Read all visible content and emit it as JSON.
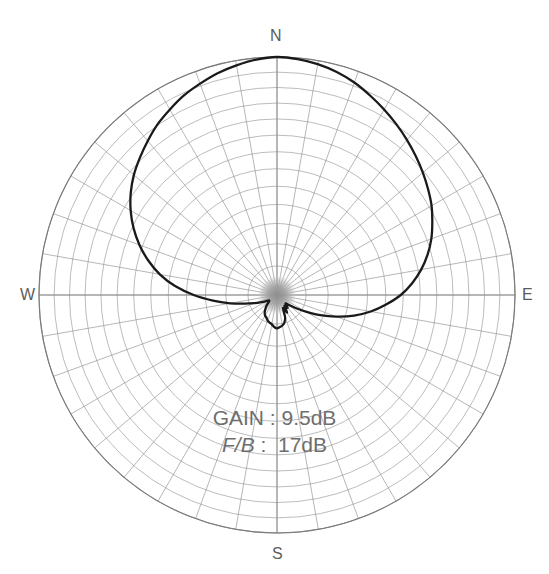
{
  "chart_data": {
    "type": "line",
    "subtype": "polar-radiation-pattern",
    "title": "",
    "xlabel": "",
    "ylabel": "",
    "grid": true,
    "legend_position": "none",
    "center": {
      "x": 277,
      "y": 295
    },
    "outer_radius": 238,
    "rings": 13,
    "spokes": 36,
    "spoke_step_deg": 10,
    "axis_range_deg": [
      0,
      360
    ],
    "cardinal_labels": {
      "north": "N",
      "south": "S",
      "east": "E",
      "west": "W"
    },
    "annotations": [
      {
        "label": "GAIN",
        "separator": ":",
        "value": "9.5dB",
        "italic_label": false
      },
      {
        "label": "F/B",
        "separator": ":",
        "value": "17dB",
        "italic_label": true
      }
    ],
    "colors": {
      "pattern_line": "#1a1a1a",
      "grid_line": "#8f8f8f",
      "outer_circle": "#7a7a7a",
      "center_blob": "#9b9b9b",
      "label_text": "#5c5c5c",
      "annotation_text": "#6e6e6e",
      "background": "#ffffff"
    },
    "series": [
      {
        "name": "radiation-pattern",
        "angle_unit": "degrees-from-north-clockwise",
        "radius_unit": "normalized-0-to-1",
        "points": [
          {
            "angle": 0,
            "r": 1.0
          },
          {
            "angle": 5,
            "r": 0.995
          },
          {
            "angle": 10,
            "r": 0.985
          },
          {
            "angle": 15,
            "r": 0.97
          },
          {
            "angle": 20,
            "r": 0.95
          },
          {
            "angle": 25,
            "r": 0.925
          },
          {
            "angle": 30,
            "r": 0.9
          },
          {
            "angle": 35,
            "r": 0.875
          },
          {
            "angle": 40,
            "r": 0.85
          },
          {
            "angle": 45,
            "r": 0.825
          },
          {
            "angle": 50,
            "r": 0.8
          },
          {
            "angle": 55,
            "r": 0.775
          },
          {
            "angle": 60,
            "r": 0.75
          },
          {
            "angle": 65,
            "r": 0.72
          },
          {
            "angle": 70,
            "r": 0.69
          },
          {
            "angle": 75,
            "r": 0.655
          },
          {
            "angle": 80,
            "r": 0.615
          },
          {
            "angle": 85,
            "r": 0.57
          },
          {
            "angle": 90,
            "r": 0.52
          },
          {
            "angle": 95,
            "r": 0.46
          },
          {
            "angle": 100,
            "r": 0.4
          },
          {
            "angle": 105,
            "r": 0.335
          },
          {
            "angle": 110,
            "r": 0.265
          },
          {
            "angle": 115,
            "r": 0.2
          },
          {
            "angle": 120,
            "r": 0.14
          },
          {
            "angle": 125,
            "r": 0.095
          },
          {
            "angle": 130,
            "r": 0.065
          },
          {
            "angle": 135,
            "r": 0.05
          },
          {
            "angle": 140,
            "r": 0.07
          },
          {
            "angle": 145,
            "r": 0.055
          },
          {
            "angle": 150,
            "r": 0.085
          },
          {
            "angle": 155,
            "r": 0.06
          },
          {
            "angle": 160,
            "r": 0.1
          },
          {
            "angle": 165,
            "r": 0.12
          },
          {
            "angle": 170,
            "r": 0.13
          },
          {
            "angle": 175,
            "r": 0.135
          },
          {
            "angle": 180,
            "r": 0.14
          },
          {
            "angle": 185,
            "r": 0.135
          },
          {
            "angle": 190,
            "r": 0.125
          },
          {
            "angle": 195,
            "r": 0.12
          },
          {
            "angle": 200,
            "r": 0.115
          },
          {
            "angle": 205,
            "r": 0.105
          },
          {
            "angle": 210,
            "r": 0.1
          },
          {
            "angle": 215,
            "r": 0.09
          },
          {
            "angle": 220,
            "r": 0.075
          },
          {
            "angle": 225,
            "r": 0.06
          },
          {
            "angle": 230,
            "r": 0.045
          },
          {
            "angle": 235,
            "r": 0.04
          },
          {
            "angle": 240,
            "r": 0.05
          },
          {
            "angle": 245,
            "r": 0.07
          },
          {
            "angle": 250,
            "r": 0.1
          },
          {
            "angle": 255,
            "r": 0.14
          },
          {
            "angle": 260,
            "r": 0.2
          },
          {
            "angle": 265,
            "r": 0.27
          },
          {
            "angle": 270,
            "r": 0.35
          },
          {
            "angle": 275,
            "r": 0.43
          },
          {
            "angle": 280,
            "r": 0.5
          },
          {
            "angle": 285,
            "r": 0.56
          },
          {
            "angle": 290,
            "r": 0.615
          },
          {
            "angle": 295,
            "r": 0.665
          },
          {
            "angle": 300,
            "r": 0.71
          },
          {
            "angle": 305,
            "r": 0.75
          },
          {
            "angle": 310,
            "r": 0.785
          },
          {
            "angle": 315,
            "r": 0.815
          },
          {
            "angle": 320,
            "r": 0.845
          },
          {
            "angle": 325,
            "r": 0.875
          },
          {
            "angle": 330,
            "r": 0.9
          },
          {
            "angle": 335,
            "r": 0.925
          },
          {
            "angle": 340,
            "r": 0.945
          },
          {
            "angle": 345,
            "r": 0.965
          },
          {
            "angle": 350,
            "r": 0.98
          },
          {
            "angle": 355,
            "r": 0.993
          }
        ]
      }
    ]
  }
}
